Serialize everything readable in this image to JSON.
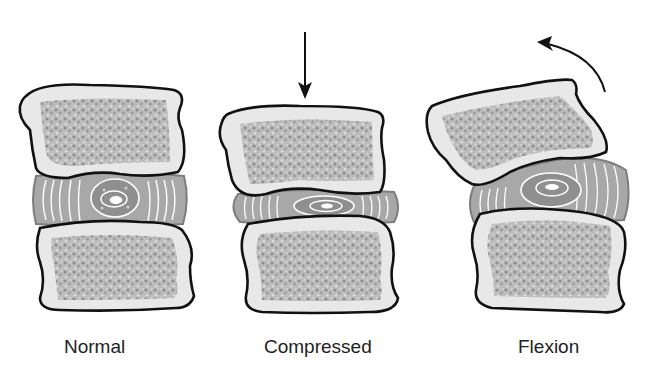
{
  "diagram": {
    "type": "intervertebral disc loading illustration",
    "panels": [
      {
        "id": "normal",
        "label": "Normal",
        "load_indicator": "none",
        "disc_state": "uniform height, centered nucleus"
      },
      {
        "id": "compressed",
        "label": "Compressed",
        "load_indicator": "straight downward arrow",
        "disc_state": "flattened disc, nucleus spread"
      },
      {
        "id": "flexion",
        "label": "Flexion",
        "load_indicator": "curved arrow (counter-clockwise, forward bend)",
        "disc_state": "wedged disc, nucleus displaced posteriorly"
      }
    ],
    "colors": {
      "outline": "#111111",
      "cortical_bone": "#e6e6e6",
      "cancellous_bone": "#b9b9b9",
      "bone_dots": "#8e8e8e",
      "disc_annulus": "#a8a8a8",
      "disc_edge": "#7d7d7d",
      "annulus_lines": "#ffffff",
      "nucleus": "#8a8a8a",
      "caption_text": "#222222"
    }
  }
}
